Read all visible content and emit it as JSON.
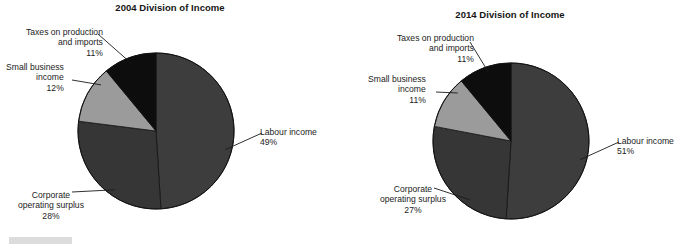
{
  "figure": {
    "background_color": "#ffffff",
    "scan_artifact": {
      "name": "scan-bar",
      "color": "#dcdcdc"
    }
  },
  "charts": [
    {
      "id": "chart-2004",
      "title": "2004 Division of Income",
      "labels": {
        "labour": {
          "name": "Labour income",
          "value": "49%"
        },
        "corporate": {
          "name_line1": "Corporate",
          "name_line2": "operating surplus",
          "value": "28%"
        },
        "small_business": {
          "name_line1": "Small business",
          "name_line2": "income",
          "value": "12%"
        },
        "taxes": {
          "name_line1": "Taxes on production",
          "name_line2": "and imports",
          "value": "11%"
        }
      }
    },
    {
      "id": "chart-2014",
      "title": "2014 Division of Income",
      "labels": {
        "labour": {
          "name": "Labour income",
          "value": "51%"
        },
        "corporate": {
          "name_line1": "Corporate",
          "name_line2": "operating surplus",
          "value": "27%"
        },
        "small_business": {
          "name_line1": "Small business",
          "name_line2": "income",
          "value": "11%"
        },
        "taxes": {
          "name_line1": "Taxes on production",
          "name_line2": "and imports",
          "value": "11%"
        }
      }
    }
  ],
  "chart_data": [
    {
      "type": "pie",
      "title": "2004 Division of Income",
      "categories": [
        "Labour income",
        "Corporate operating surplus",
        "Small business income",
        "Taxes on production and imports"
      ],
      "values": [
        49,
        28,
        12,
        11
      ],
      "unit": "%",
      "colors": [
        "#3d3d3d",
        "#363636",
        "#9b9b9b",
        "#0d0d0d"
      ],
      "start_angle_deg": 0,
      "direction": "clockwise",
      "legend": "none",
      "labels_position": "outside-with-leader-lines",
      "center_px": [
        156,
        131
      ],
      "radius_px": 78
    },
    {
      "type": "pie",
      "title": "2014 Division of Income",
      "categories": [
        "Labour income",
        "Corporate operating surplus",
        "Small business income",
        "Taxes on production and imports"
      ],
      "values": [
        51,
        27,
        11,
        11
      ],
      "unit": "%",
      "colors": [
        "#3d3d3d",
        "#363636",
        "#9b9b9b",
        "#0d0d0d"
      ],
      "start_angle_deg": 0,
      "direction": "clockwise",
      "legend": "none",
      "labels_position": "outside-with-leader-lines",
      "center_px": [
        171,
        141
      ],
      "radius_px": 78
    }
  ]
}
